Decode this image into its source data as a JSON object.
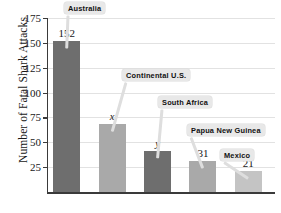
{
  "chart_data": {
    "type": "bar",
    "title": "",
    "xlabel": "",
    "ylabel": "Number of Fatal Shark Attacks",
    "ylim": [
      0,
      175
    ],
    "grid": true,
    "legend": "none",
    "yticks": [
      25,
      50,
      75,
      100,
      125,
      150,
      175
    ],
    "categories": [
      "Australia",
      "Continental U.S.",
      "South Africa",
      "Papua New Guinea",
      "Mexico"
    ],
    "values": [
      152,
      68,
      41,
      31,
      21
    ],
    "value_labels": [
      "152",
      "x",
      "y",
      "31",
      "21"
    ],
    "bar_colors": [
      "#6e6e6e",
      "#a9a9a9",
      "#6e6e6e",
      "#a9a9a9",
      "#c4c4c4"
    ],
    "annotations": [
      {
        "text": "Australia",
        "points_to": "Australia"
      },
      {
        "text": "Continental U.S.",
        "points_to": "Continental U.S."
      },
      {
        "text": "South Africa",
        "points_to": "South Africa"
      },
      {
        "text": "Papua New Guinea",
        "points_to": "Papua New Guinea"
      },
      {
        "text": "Mexico",
        "points_to": "Mexico"
      }
    ]
  },
  "axis": {
    "y_title": "Number of Fatal Shark Attacks",
    "ticks": [
      "175",
      "150",
      "125",
      "100",
      "75",
      "50",
      "25"
    ]
  },
  "bars": {
    "b0_label": "152",
    "b1_label": "x",
    "b2_label": "y",
    "b3_label": "31",
    "b4_label": "21"
  },
  "callouts": {
    "c0": "Australia",
    "c1": "Continental U.S.",
    "c2": "South Africa",
    "c3": "Papua New Guinea",
    "c4": "Mexico"
  }
}
